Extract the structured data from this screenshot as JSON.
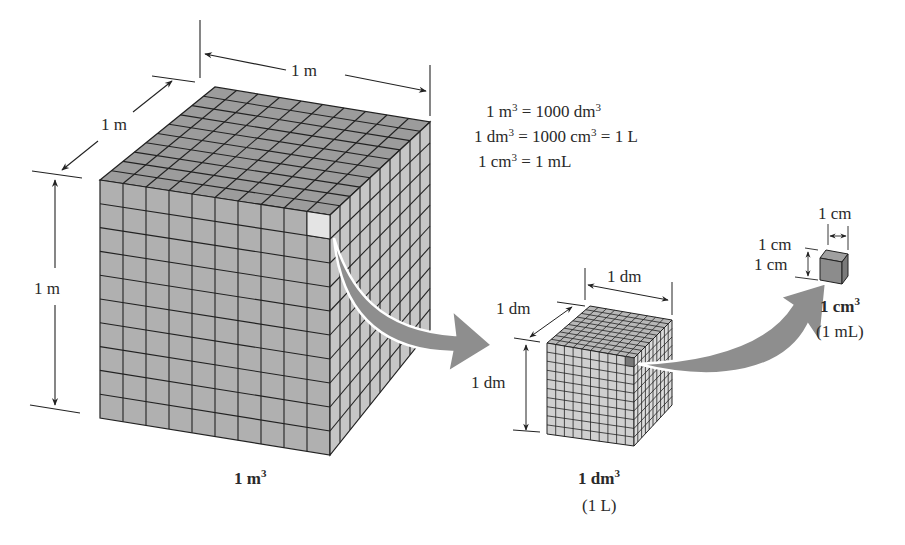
{
  "figure": {
    "colors": {
      "cube_front": "#b4b4b4",
      "cube_top": "#9a9a9a",
      "cube_right": "#c4c4c4",
      "grid_line": "#222222",
      "arrow_fill": "#8a8a8a",
      "dimension_line": "#222222"
    }
  },
  "equations": [
    {
      "lhs_num": "1 m",
      "lhs_exp": "3",
      "rhs": "= 1000 dm",
      "rhs_exp": "3",
      "tail": ""
    },
    {
      "lhs_num": "1 dm",
      "lhs_exp": "3",
      "rhs": "= 1000 cm",
      "rhs_exp": "3",
      "tail": " = 1 L"
    },
    {
      "lhs_num": "1 cm",
      "lhs_exp": "3",
      "rhs": "= 1 mL",
      "rhs_exp": "",
      "tail": ""
    }
  ],
  "cubes": [
    {
      "id": "cubic-meter",
      "grid_divisions": 10,
      "dimensions": {
        "width": "1 m",
        "depth": "1 m",
        "height": "1 m"
      },
      "caption_main": "1 m",
      "caption_exp": "3",
      "caption_sub": ""
    },
    {
      "id": "cubic-decimeter",
      "grid_divisions": 10,
      "dimensions": {
        "width": "1 dm",
        "depth": "1 dm",
        "height": "1 dm"
      },
      "caption_main": "1 dm",
      "caption_exp": "3",
      "caption_sub": "(1 L)"
    },
    {
      "id": "cubic-centimeter",
      "grid_divisions": 1,
      "dimensions": {
        "width": "1 cm",
        "depth": "1 cm",
        "height": "1 cm"
      },
      "caption_main": "1 cm",
      "caption_exp": "3",
      "caption_sub": "(1 mL)"
    }
  ]
}
